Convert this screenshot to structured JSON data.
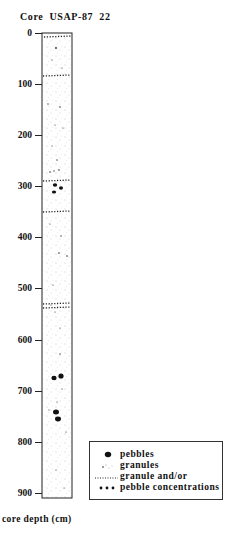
{
  "title": "Core  USAP-87  22",
  "axis": {
    "label": "core depth (cm)",
    "ticks": [
      "0",
      "100",
      "200",
      "300",
      "400",
      "500",
      "600",
      "700",
      "800",
      "900"
    ]
  },
  "legend": {
    "items": [
      {
        "symbol": "pebble-icon",
        "label": "pebbles"
      },
      {
        "symbol": "granule-dots-icon",
        "label": "granules"
      },
      {
        "symbol": "dotted-line-icon",
        "label": "granule and/or"
      },
      {
        "symbol": "triple-dot-icon",
        "label": "pebble concentrations"
      }
    ]
  },
  "core": {
    "depth_range_cm": [
      0,
      910
    ],
    "concentration_horizons_cm": [
      5,
      85,
      290,
      350,
      515,
      525
    ],
    "pebbles_cm": [
      305,
      310,
      318,
      630,
      635,
      735,
      755
    ]
  }
}
